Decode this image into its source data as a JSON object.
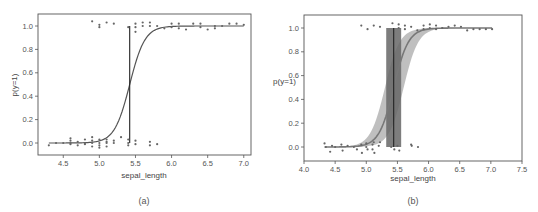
{
  "figure": {
    "colors": {
      "axis": "#555555",
      "curve_a": "#555555",
      "curve_b": "#777777",
      "band_b": "#aaaaaa",
      "points": "#666666",
      "box": "#666666",
      "boundary_line": "#222222"
    }
  },
  "chart_data": [
    {
      "id": "a",
      "type": "scatter",
      "panel_label": "(a)",
      "title": "",
      "xlabel": "sepal_length",
      "ylabel": "p(y=1)",
      "xlim": [
        4.15,
        7.1
      ],
      "ylim": [
        -0.11,
        1.1
      ],
      "xticks": [
        4.5,
        5.0,
        5.5,
        6.0,
        6.5,
        7.0
      ],
      "xtick_labels": [
        "4.5",
        "5.0",
        "5.5",
        "6.0",
        "6.5",
        "7.0"
      ],
      "yticks": [
        0.0,
        0.2,
        0.4,
        0.6,
        0.8,
        1.0
      ],
      "ytick_labels": [
        "0.0",
        "0.2",
        "0.4",
        "0.6",
        "0.8",
        "1.0"
      ],
      "grid": false,
      "legend": null,
      "series": [
        {
          "name": "logistic fit",
          "kind": "line",
          "midpoint": 5.42,
          "slope": 9.5
        },
        {
          "name": "decision boundary",
          "kind": "vline",
          "x": 5.42,
          "y_range": [
            0.0,
            1.0
          ]
        },
        {
          "name": "class 0 (jittered)",
          "kind": "points",
          "points": [
            [
              4.3,
              -0.02
            ],
            [
              4.4,
              0.0
            ],
            [
              4.5,
              0.0
            ],
            [
              4.6,
              0.0
            ],
            [
              4.6,
              0.02
            ],
            [
              4.6,
              0.04
            ],
            [
              4.6,
              -0.01
            ],
            [
              4.7,
              0.01
            ],
            [
              4.7,
              -0.02
            ],
            [
              4.8,
              0.0
            ],
            [
              4.8,
              0.03
            ],
            [
              4.8,
              -0.01
            ],
            [
              4.9,
              0.05
            ],
            [
              4.9,
              0.02
            ],
            [
              4.9,
              -0.03
            ],
            [
              4.9,
              0.0
            ],
            [
              5.0,
              0.03
            ],
            [
              5.0,
              -0.02
            ],
            [
              5.0,
              -0.04
            ],
            [
              5.0,
              0.0
            ],
            [
              5.1,
              0.03
            ],
            [
              5.1,
              0.0
            ],
            [
              5.1,
              -0.03
            ],
            [
              5.1,
              0.01
            ],
            [
              5.2,
              0.02
            ],
            [
              5.2,
              0.0
            ],
            [
              5.3,
              0.05
            ],
            [
              5.4,
              0.0
            ],
            [
              5.4,
              0.03
            ],
            [
              5.4,
              -0.02
            ],
            [
              5.5,
              0.02
            ],
            [
              5.5,
              -0.01
            ],
            [
              5.7,
              0.01
            ],
            [
              5.7,
              -0.02
            ],
            [
              5.8,
              -0.01
            ]
          ]
        },
        {
          "name": "class 1 (jittered)",
          "kind": "points",
          "points": [
            [
              4.9,
              1.04
            ],
            [
              5.0,
              1.01
            ],
            [
              5.0,
              0.99
            ],
            [
              5.1,
              1.03
            ],
            [
              5.2,
              1.02
            ],
            [
              5.4,
              0.99
            ],
            [
              5.5,
              1.02
            ],
            [
              5.5,
              0.99
            ],
            [
              5.5,
              0.95
            ],
            [
              5.6,
              1.03
            ],
            [
              5.6,
              1.0
            ],
            [
              5.7,
              1.03
            ],
            [
              5.7,
              1.0
            ],
            [
              5.8,
              1.0
            ],
            [
              5.9,
              0.98
            ],
            [
              6.0,
              1.02
            ],
            [
              6.0,
              0.99
            ],
            [
              6.1,
              1.02
            ],
            [
              6.1,
              0.98
            ],
            [
              6.2,
              0.97
            ],
            [
              6.3,
              1.02
            ],
            [
              6.4,
              1.02
            ],
            [
              6.4,
              0.99
            ],
            [
              6.5,
              0.97
            ],
            [
              6.6,
              1.0
            ],
            [
              6.6,
              0.98
            ],
            [
              6.7,
              1.0
            ],
            [
              6.8,
              1.02
            ],
            [
              6.9,
              1.02
            ],
            [
              7.0,
              1.01
            ]
          ]
        }
      ]
    },
    {
      "id": "b",
      "type": "scatter",
      "panel_label": "(b)",
      "title": "",
      "xlabel": "sepal_length",
      "ylabel": "p(y=1)",
      "xlim": [
        4.0,
        7.5
      ],
      "ylim": [
        -0.11,
        1.1
      ],
      "xticks": [
        4.0,
        4.5,
        5.0,
        5.5,
        6.0,
        6.5,
        7.0,
        7.5
      ],
      "xtick_labels": [
        "4.0",
        "4.5",
        "5.0",
        "5.5",
        "6.0",
        "6.5",
        "7.0",
        "7.5"
      ],
      "yticks": [
        0.0,
        0.2,
        0.4,
        0.6,
        0.8,
        1.0
      ],
      "ytick_labels": [
        "0.0",
        "0.2",
        "0.4",
        "0.6",
        "0.8",
        "1.0"
      ],
      "grid": false,
      "legend": null,
      "series": [
        {
          "name": "mean logistic fit",
          "kind": "line",
          "midpoint": 5.44,
          "slope": 8.5
        },
        {
          "name": "HPD band of fit",
          "kind": "band",
          "midpoint_low": 5.3,
          "midpoint_high": 5.6,
          "slope": 8.5
        },
        {
          "name": "decision boundary HPD",
          "kind": "vspan",
          "x_range": [
            5.32,
            5.56
          ],
          "y_range": [
            0.0,
            1.0
          ]
        },
        {
          "name": "decision boundary mean",
          "kind": "vline",
          "x": 5.44,
          "y_range": [
            0.0,
            1.0
          ]
        },
        {
          "name": "class 0 (jittered)",
          "kind": "points",
          "points": [
            [
              4.33,
              0.03
            ],
            [
              4.35,
              0.0
            ],
            [
              4.42,
              -0.04
            ],
            [
              4.45,
              0.01
            ],
            [
              4.5,
              0.0
            ],
            [
              4.6,
              0.02
            ],
            [
              4.62,
              -0.03
            ],
            [
              4.7,
              0.01
            ],
            [
              4.8,
              0.0
            ],
            [
              4.85,
              -0.02
            ],
            [
              4.92,
              0.02
            ],
            [
              4.93,
              -0.05
            ],
            [
              5.0,
              0.03
            ],
            [
              5.0,
              0.0
            ],
            [
              5.02,
              -0.02
            ],
            [
              5.1,
              0.02
            ],
            [
              5.1,
              -0.02
            ],
            [
              5.12,
              0.04
            ],
            [
              5.13,
              -0.05
            ],
            [
              5.2,
              0.01
            ],
            [
              5.22,
              0.04
            ],
            [
              5.4,
              0.0
            ],
            [
              5.45,
              -0.02
            ],
            [
              5.5,
              0.01
            ],
            [
              5.53,
              -0.03
            ],
            [
              5.72,
              0.02
            ],
            [
              5.73,
              0.01
            ],
            [
              5.83,
              0.0
            ]
          ]
        },
        {
          "name": "class 1 (jittered)",
          "kind": "points",
          "points": [
            [
              4.92,
              1.02
            ],
            [
              5.02,
              0.99
            ],
            [
              5.12,
              1.02
            ],
            [
              5.22,
              1.01
            ],
            [
              5.42,
              1.04
            ],
            [
              5.52,
              1.03
            ],
            [
              5.52,
              1.0
            ],
            [
              5.62,
              1.02
            ],
            [
              5.62,
              0.99
            ],
            [
              5.72,
              1.01
            ],
            [
              5.82,
              0.98
            ],
            [
              5.92,
              1.02
            ],
            [
              5.92,
              0.99
            ],
            [
              6.02,
              1.03
            ],
            [
              6.02,
              1.0
            ],
            [
              6.12,
              1.02
            ],
            [
              6.12,
              0.99
            ],
            [
              6.22,
              1.0
            ],
            [
              6.32,
              1.01
            ],
            [
              6.42,
              1.02
            ],
            [
              6.52,
              1.01
            ],
            [
              6.62,
              0.98
            ],
            [
              6.72,
              0.99
            ],
            [
              6.82,
              0.99
            ],
            [
              6.92,
              0.99
            ],
            [
              7.02,
              0.99
            ]
          ]
        }
      ]
    }
  ]
}
